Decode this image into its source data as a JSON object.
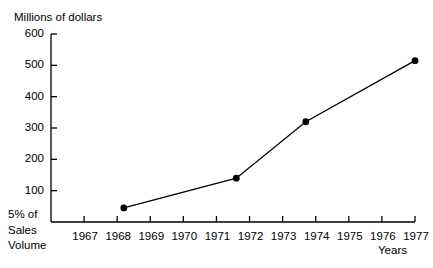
{
  "chart_data": {
    "type": "line",
    "title": "",
    "ylabel": "Millions of dollars",
    "xlabel": "Years",
    "origin_label_lines": [
      "5% of",
      "Sales",
      "Volume"
    ],
    "x": [
      1968.2,
      1971.6,
      1973.7,
      1977.0
    ],
    "values": [
      45,
      140,
      320,
      515
    ],
    "series": [
      {
        "name": "Sales",
        "points": [
          {
            "x": 1968.2,
            "y": 45
          },
          {
            "x": 1971.6,
            "y": 140
          },
          {
            "x": 1973.7,
            "y": 320
          },
          {
            "x": 1977.0,
            "y": 515
          }
        ]
      }
    ],
    "ylim": [
      0,
      600
    ],
    "xlim": [
      1966.5,
      1977.5
    ],
    "ytick_values": [
      100,
      200,
      300,
      400,
      500,
      600
    ],
    "ytick_labels": [
      "100",
      "200",
      "300",
      "400",
      "500",
      "600"
    ],
    "xtick_values": [
      1967,
      1968,
      1969,
      1970,
      1971,
      1972,
      1973,
      1974,
      1975,
      1976,
      1977
    ],
    "xtick_labels": [
      "1967",
      "1968",
      "1969",
      "1970",
      "1971",
      "1972",
      "1973",
      "1974",
      "1975",
      "1976",
      "1977"
    ],
    "grid": false,
    "legend": "none",
    "line_color": "#000000",
    "marker_color": "#000000",
    "axis_color": "#000000",
    "background_color": "#ffffff"
  }
}
